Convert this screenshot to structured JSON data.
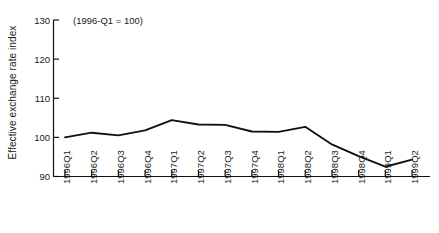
{
  "chart_data": {
    "type": "line",
    "title": "",
    "subtitle": "",
    "annotation": "(1996-Q1 = 100)",
    "xlabel": "",
    "ylabel": "Effective exchange rate index",
    "categories": [
      "1996Q1",
      "1996Q2",
      "1996Q3",
      "1996Q4",
      "1997Q1",
      "1997Q2",
      "1997Q3",
      "1997Q4",
      "1998Q1",
      "1998Q2",
      "1998Q3",
      "1998Q4",
      "1999Q1",
      "1999Q2"
    ],
    "values": [
      100.0,
      101.2,
      100.5,
      101.8,
      104.4,
      103.3,
      103.2,
      101.5,
      101.4,
      102.7,
      98.2,
      95.2,
      92.5,
      94.3
    ],
    "series": [
      {
        "name": "Effective exchange rate index",
        "values": [
          100.0,
          101.2,
          100.5,
          101.8,
          104.4,
          103.3,
          103.2,
          101.5,
          101.4,
          102.7,
          98.2,
          95.2,
          92.5,
          94.3
        ]
      }
    ],
    "ylim": [
      90,
      130
    ],
    "yticks": [
      90,
      100,
      110,
      120,
      130
    ],
    "ytick_labels": [
      "90",
      "100",
      "110",
      "120",
      "130"
    ],
    "grid": false,
    "legend": false,
    "legend_position": "none",
    "line_color": "#111111",
    "axis_color": "#111111",
    "background_color": "#ffffff"
  }
}
